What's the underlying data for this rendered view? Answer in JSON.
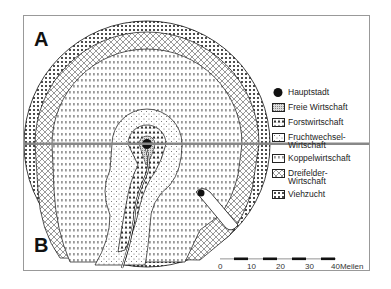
{
  "panels": {
    "top": "A",
    "bottom": "B"
  },
  "legend": [
    {
      "key": "hauptstadt",
      "label": "Hauptstadt",
      "symbol": "filled-circle"
    },
    {
      "key": "freie",
      "label": "Freie Wirtschaft",
      "symbol": "fine-stipple"
    },
    {
      "key": "forst",
      "label": "Forstwirtschaft",
      "symbol": "tree-pattern"
    },
    {
      "key": "frucht",
      "label": "Fruchtwechsel-\nWirtschaft",
      "symbol": "sparse-dots"
    },
    {
      "key": "koppel",
      "label": "Koppelwirtschaft",
      "symbol": "dash-pattern"
    },
    {
      "key": "dreifelder",
      "label": "Dreifelder-\nWirtschaft",
      "symbol": "crosshatch"
    },
    {
      "key": "vieh",
      "label": "Viehzucht",
      "symbol": "heavy-dots"
    }
  ],
  "scale_bar": {
    "ticks": [
      "0",
      "10",
      "20",
      "30",
      "40"
    ],
    "unit": "Meilen",
    "last_label": "40Meilen"
  },
  "colors": {
    "ink": "#111111",
    "paper": "#ffffff",
    "frame": "#999999"
  }
}
